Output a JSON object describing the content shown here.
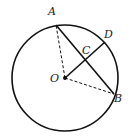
{
  "diagram": {
    "type": "circle-geometry",
    "colors": {
      "stroke": "#111111",
      "background": "#ffffff"
    },
    "circle": {
      "center": "O",
      "cx": 65,
      "cy": 78,
      "r": 53
    },
    "points": {
      "A": {
        "label": "A",
        "x": 56,
        "y": 25
      },
      "B": {
        "label": "B",
        "x": 114,
        "y": 94
      },
      "C": {
        "label": "C",
        "x": 85,
        "y": 60
      },
      "D": {
        "label": "D",
        "x": 105,
        "y": 42
      },
      "O": {
        "label": "O",
        "x": 65,
        "y": 78
      }
    },
    "segments": [
      {
        "from": "A",
        "to": "B",
        "style": "solid"
      },
      {
        "from": "O",
        "to": "D",
        "style": "solid"
      },
      {
        "from": "O",
        "to": "A",
        "style": "dashed"
      },
      {
        "from": "O",
        "to": "B",
        "style": "dashed"
      }
    ]
  }
}
